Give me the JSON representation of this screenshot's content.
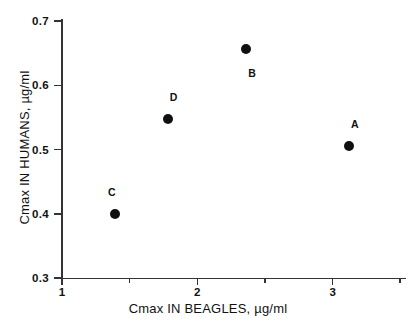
{
  "chart_data": {
    "type": "scatter",
    "title": "",
    "xlabel": "Cmax IN BEAGLES, µg/ml",
    "ylabel": "Cmax IN HUMANS, µg/ml",
    "xlim": [
      1,
      3.55
    ],
    "ylim": [
      0.3,
      0.7
    ],
    "grid": false,
    "legend": "none",
    "marker": {
      "shape": "circle",
      "color": "#101010",
      "size_px": 10
    },
    "x_ticks": [
      {
        "value": 1,
        "label": "1",
        "major": true
      },
      {
        "value": 1.5,
        "label": "",
        "major": false
      },
      {
        "value": 2,
        "label": "2",
        "major": true
      },
      {
        "value": 2.5,
        "label": "",
        "major": false
      },
      {
        "value": 3,
        "label": "3",
        "major": true
      },
      {
        "value": 3.5,
        "label": "",
        "major": false
      }
    ],
    "y_ticks": [
      {
        "value": 0.7,
        "label": "0.7"
      },
      {
        "value": 0.6,
        "label": "0.6"
      },
      {
        "value": 0.5,
        "label": "0.5"
      },
      {
        "value": 0.4,
        "label": "0.4"
      },
      {
        "value": 0.3,
        "label": "0.3"
      }
    ],
    "points": [
      {
        "label": "C",
        "x": 1.39,
        "y": 0.4,
        "label_position": "above-left"
      },
      {
        "label": "D",
        "x": 1.78,
        "y": 0.548,
        "label_position": "above-right"
      },
      {
        "label": "B",
        "x": 2.36,
        "y": 0.656,
        "label_position": "below-right"
      },
      {
        "label": "A",
        "x": 3.12,
        "y": 0.505,
        "label_position": "above-right"
      }
    ]
  },
  "axis": {
    "x_title": "Cmax IN BEAGLES, µg/ml",
    "y_title": "Cmax IN HUMANS, µg/ml"
  },
  "colors": {
    "marker": "#101010",
    "axis": "#333333",
    "text": "#111111",
    "background": "#ffffff"
  }
}
